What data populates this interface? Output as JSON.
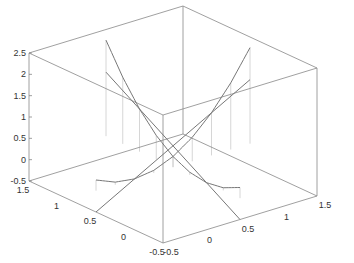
{
  "chart_data": {
    "type": "line",
    "title": "",
    "subtitle": "",
    "plot_style": "3d-surface-with-impulses",
    "grid": false,
    "legend": "none",
    "xaxis": {
      "label": "",
      "range": [
        -0.5,
        1.5
      ],
      "ticks": [
        "-0.5",
        "0",
        "0.5",
        "1",
        "1.5"
      ]
    },
    "yaxis": {
      "label": "",
      "range": [
        -0.5,
        1.5
      ],
      "ticks": [
        "-0.5",
        "0",
        "0.5",
        "1",
        "1.5"
      ]
    },
    "zaxis": {
      "label": "",
      "range": [
        -0.5,
        2.5
      ],
      "ticks": [
        "-0.5",
        "0",
        "0.5",
        "1",
        "1.5",
        "2",
        "2.5"
      ]
    },
    "series": [
      {
        "name": "parabola-a",
        "description": "z = t^2 along x",
        "x": [
          -0.5,
          -0.25,
          0,
          0.25,
          0.5,
          0.75,
          1,
          1.25,
          1.5
        ],
        "y": [
          0.5,
          0.5,
          0.5,
          0.5,
          0.5,
          0.5,
          0.5,
          0.5,
          0.5
        ],
        "z": [
          0.25,
          0.0625,
          0,
          0.0625,
          0.25,
          0.5625,
          1,
          1.5625,
          2.25
        ]
      },
      {
        "name": "parabola-b",
        "description": "z = t^2 along y",
        "x": [
          0.5,
          0.5,
          0.5,
          0.5,
          0.5,
          0.5,
          0.5,
          0.5,
          0.5
        ],
        "y": [
          -0.5,
          -0.25,
          0,
          0.25,
          0.5,
          0.75,
          1,
          1.25,
          1.5
        ],
        "z": [
          0.25,
          0.0625,
          0,
          0.0625,
          0.25,
          0.5625,
          1,
          1.5625,
          2.25
        ]
      },
      {
        "name": "line-a",
        "x": [
          -0.5,
          1.5
        ],
        "y": [
          0.5,
          0.5
        ],
        "z": [
          -0.5,
          1.5
        ]
      },
      {
        "name": "line-b",
        "x": [
          0.5,
          0.5
        ],
        "y": [
          -0.5,
          1.5
        ],
        "z": [
          -0.5,
          1.5
        ]
      }
    ],
    "colors": {
      "axis": "#888888",
      "curve": "#777777",
      "impulse": "#cccccc",
      "text": "#333333"
    }
  }
}
